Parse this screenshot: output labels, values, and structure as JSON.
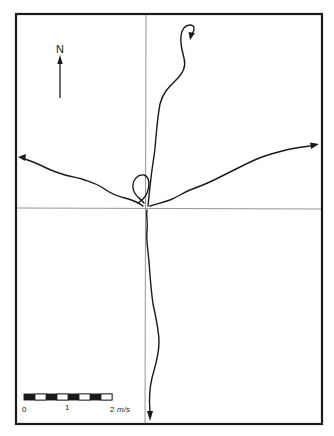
{
  "figure": {
    "type": "wind/current vector trajectory diagram",
    "colors": {
      "ink": "#1a1a1a",
      "axis": "#8a8a8a",
      "background": "#ffffff"
    }
  },
  "north_arrow": {
    "label": "N"
  },
  "scale_bar": {
    "tick_labels": [
      "0",
      "1",
      "2"
    ],
    "unit": "m/s",
    "segments": 8
  },
  "tracks": [
    {
      "name": "north-track",
      "direction": "north",
      "end": "hooked arrow at top"
    },
    {
      "name": "west-track",
      "direction": "west-northwest",
      "end": "arrow at left edge"
    },
    {
      "name": "east-track",
      "direction": "east-northeast",
      "end": "arrow at right edge"
    },
    {
      "name": "south-track",
      "direction": "south",
      "end": "arrow at bottom edge"
    }
  ]
}
